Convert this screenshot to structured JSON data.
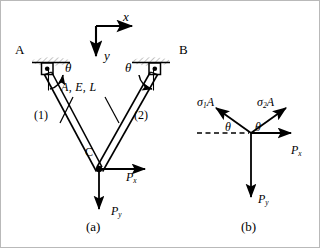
{
  "figure": {
    "caption_a": "(a)",
    "caption_b": "(b)",
    "background_color": "#ffffff",
    "line_color": "#000000",
    "hatch_color": "#c9c9c9"
  },
  "panel_a": {
    "title": "Two-bar pin-jointed truss",
    "support_left_label": "A",
    "support_right_label": "B",
    "joint_label": "C",
    "axis": {
      "x_label": "x",
      "y_label": "y",
      "origin_px": [
        95,
        25
      ],
      "x_arrow_end_px": [
        136,
        25
      ],
      "y_arrow_end_px": [
        95,
        59
      ]
    },
    "angle_left_label": "θ",
    "angle_right_label": "θ",
    "member_properties_label": "A, E, L",
    "member_1_label": "(1)",
    "member_2_label": "(2)",
    "load_x_label": "P",
    "load_x_sub": "x",
    "load_y_label": "P",
    "load_y_sub": "y",
    "geometry": {
      "support_left_px": [
        45,
        68
      ],
      "support_right_px": [
        155,
        68
      ],
      "joint_c_px": [
        98,
        168
      ]
    }
  },
  "panel_b": {
    "title": "Free-body diagram of joint C",
    "force_1_label": "σ",
    "force_1_sub": "1",
    "force_1_suffix": "A",
    "force_2_label": "σ",
    "force_2_sub": "2",
    "force_2_suffix": "A",
    "angle_left_label": "θ",
    "angle_right_label": "θ",
    "load_x_label": "P",
    "load_x_sub": "x",
    "load_y_label": "P",
    "load_y_sub": "y",
    "geometry": {
      "origin_px": [
        250,
        132
      ]
    }
  }
}
